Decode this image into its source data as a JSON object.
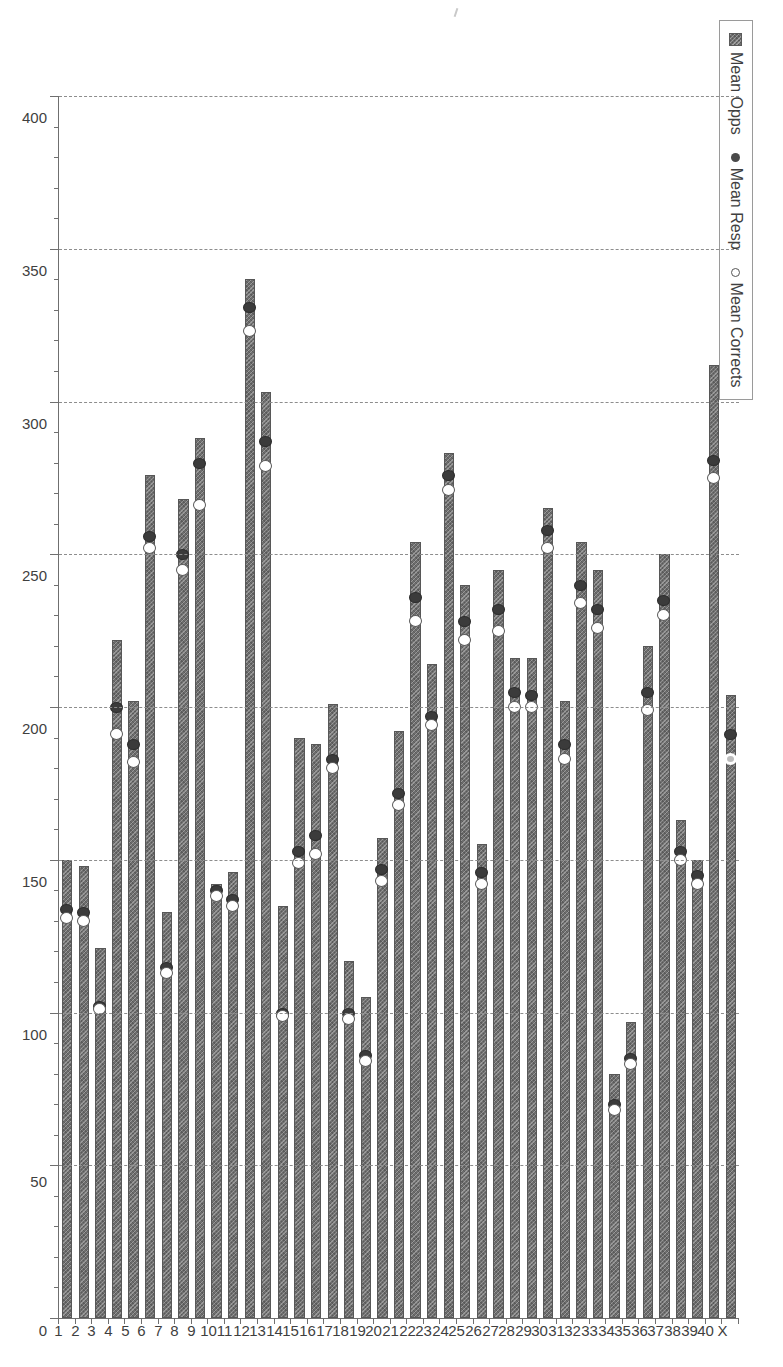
{
  "legend": {
    "title": "",
    "entries": [
      {
        "label": "Mean Opps",
        "marker": "filled-square-hatched",
        "color": "#6e6e6e"
      },
      {
        "label": "Mean Resp",
        "marker": "filled-circle",
        "color": "#3b3b3b"
      },
      {
        "label": "Mean Corrects",
        "marker": "open-circle",
        "color": "#ffffff"
      }
    ]
  },
  "axes": {
    "category_title": "Episode Number",
    "value_title": "",
    "value_ticks": [
      "0",
      "50",
      "100",
      "150",
      "200",
      "250",
      "300",
      "350",
      "400"
    ]
  },
  "chart_data": {
    "type": "bar",
    "orientation": "horizontal",
    "title": "",
    "xlabel": "Episode Number",
    "ylabel": "",
    "ylim": [
      0,
      400
    ],
    "grid": true,
    "legend_position": "top-left",
    "categories": [
      "1",
      "2",
      "3",
      "4",
      "5",
      "6",
      "7",
      "8",
      "9",
      "10",
      "11",
      "12",
      "13",
      "14",
      "15",
      "16",
      "17",
      "18",
      "19",
      "20",
      "21",
      "22",
      "23",
      "24",
      "25",
      "26",
      "27",
      "28",
      "29",
      "30",
      "31",
      "32",
      "33",
      "34",
      "35",
      "36",
      "37",
      "38",
      "39",
      "40",
      "X"
    ],
    "series": [
      {
        "name": "Mean Opps",
        "values": [
          150,
          148,
          121,
          222,
          202,
          276,
          133,
          268,
          288,
          142,
          146,
          340,
          303,
          135,
          190,
          188,
          201,
          117,
          105,
          157,
          192,
          254,
          214,
          283,
          240,
          155,
          245,
          216,
          216,
          265,
          202,
          254,
          245,
          80,
          97,
          220,
          250,
          163,
          150,
          312,
          204
        ]
      },
      {
        "name": "Mean Resp",
        "values": [
          134,
          133,
          102,
          200,
          188,
          256,
          115,
          250,
          280,
          140,
          137,
          331,
          287,
          100,
          153,
          158,
          183,
          100,
          86,
          147,
          172,
          236,
          197,
          276,
          228,
          146,
          232,
          205,
          204,
          258,
          188,
          240,
          232,
          70,
          85,
          205,
          235,
          153,
          145,
          281,
          191
        ]
      },
      {
        "name": "Mean Corrects",
        "values": [
          131,
          130,
          101,
          191,
          182,
          252,
          113,
          245,
          266,
          138,
          135,
          323,
          279,
          99,
          149,
          152,
          180,
          98,
          84,
          143,
          168,
          228,
          194,
          271,
          222,
          142,
          225,
          200,
          200,
          252,
          183,
          234,
          226,
          68,
          83,
          199,
          230,
          150,
          142,
          275,
          183
        ]
      }
    ]
  }
}
